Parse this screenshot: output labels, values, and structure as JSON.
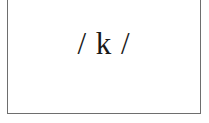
{
  "card": {
    "text": "/ k /"
  },
  "colors": {
    "border": "#6e6e6e",
    "text": "#1a1a1a",
    "background": "#ffffff"
  }
}
